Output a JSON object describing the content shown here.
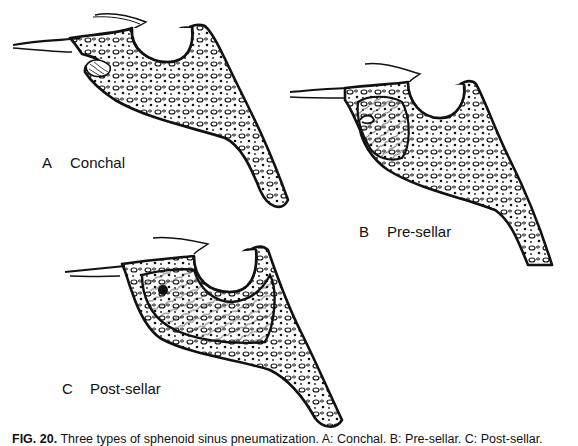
{
  "figure": {
    "panels": [
      {
        "letter": "A",
        "name": "Conchal"
      },
      {
        "letter": "B",
        "name": "Pre-sellar"
      },
      {
        "letter": "C",
        "name": "Post-sellar"
      }
    ],
    "caption": {
      "fig_label": "FIG. 20.",
      "text": "Three types of sphenoid sinus pneumatization. A: Conchal. B: Pre-sellar. C: Post-sellar."
    }
  }
}
